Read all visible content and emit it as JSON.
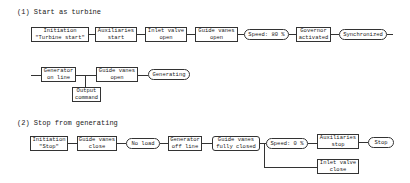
{
  "section1": {
    "title": "(1) Start as turbine",
    "row1": [
      {
        "line1": "Initiation",
        "line2": "\"Turbine start\""
      },
      {
        "line1": "Auxiliaries",
        "line2": "start"
      },
      {
        "line1": "Inlet valve",
        "line2": "open"
      },
      {
        "line1": "Guide vanes",
        "line2": "open"
      },
      {
        "label": "Speed: 80 %"
      },
      {
        "line1": "Governor",
        "line2": "activated"
      },
      {
        "label": "Synchronized"
      }
    ],
    "row2": [
      {
        "line1": "Generator",
        "line2": "on line"
      },
      {
        "line1": "Guide vanes",
        "line2": "open"
      },
      {
        "label": "Generating"
      }
    ],
    "branch": {
      "line1": "Output",
      "line2": "command"
    }
  },
  "section2": {
    "title": "(2) Stop from generating",
    "row": [
      {
        "line1": "Initiation",
        "line2": "\"Stop\""
      },
      {
        "line1": "Guide vanes",
        "line2": "close"
      },
      {
        "label": "No load"
      },
      {
        "line1": "Generator",
        "line2": "off line"
      },
      {
        "line1": "Guide vanes",
        "line2": "fully closed"
      },
      {
        "label": "Speed: 0 %"
      },
      {
        "line1": "Auxiliaries",
        "line2": "stop"
      },
      {
        "label": "Stop"
      }
    ],
    "branch": {
      "line1": "Inlet valve",
      "line2": "close"
    }
  }
}
